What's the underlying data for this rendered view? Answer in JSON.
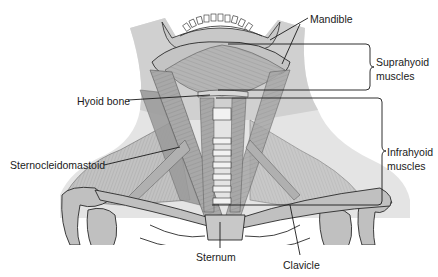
{
  "figure": {
    "labels": {
      "mandible": "Mandible",
      "hyoid_bone": "Hyoid bone",
      "suprahyoid_line1": "Suprahyoid",
      "suprahyoid_line2": "muscles",
      "infrahyoid_line1": "Infrahyoid",
      "infrahyoid_line2": "muscles",
      "sternocleidomastoid": "Sternocleidomastoid",
      "sternum": "Sternum",
      "clavicle": "Clavicle"
    },
    "colors": {
      "skin": "#d4d4d4",
      "skin_light": "#e6e6e6",
      "muscle": "#a8a8a8",
      "muscle_dark": "#8c8c8c",
      "bone": "#bdbdbd",
      "outline": "#2a2a2a",
      "leader": "#1a1a1a",
      "background": "#ffffff"
    }
  }
}
